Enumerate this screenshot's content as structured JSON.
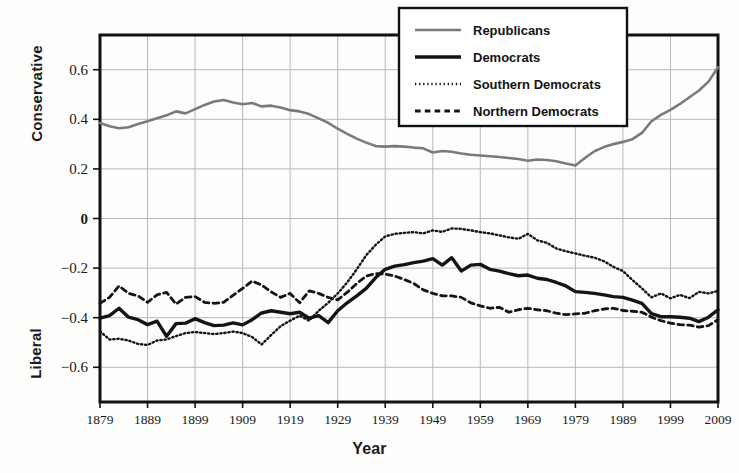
{
  "chart_data": {
    "type": "line",
    "title": "",
    "xlabel": "Year",
    "ylabel": "",
    "ylabel_top": "Conservative",
    "ylabel_bottom": "Liberal",
    "xlim": [
      1879,
      2009
    ],
    "ylim": [
      -0.74,
      0.74
    ],
    "xticks": [
      1879,
      1889,
      1899,
      1909,
      1919,
      1929,
      1939,
      1949,
      1959,
      1969,
      1979,
      1989,
      1999,
      2009
    ],
    "yticks": [
      0.6,
      0.4,
      0.2,
      0,
      -0.2,
      -0.4,
      -0.6
    ],
    "ytick_labels": [
      "0.6",
      "0.4",
      "0.2",
      "0",
      "−0.2",
      "−0.4",
      "−0.6"
    ],
    "grid": true,
    "legend_position": "top-center",
    "x": [
      1879,
      1881,
      1883,
      1885,
      1887,
      1889,
      1891,
      1893,
      1895,
      1897,
      1899,
      1901,
      1903,
      1905,
      1907,
      1909,
      1911,
      1913,
      1915,
      1917,
      1919,
      1921,
      1923,
      1925,
      1927,
      1929,
      1931,
      1933,
      1935,
      1937,
      1939,
      1941,
      1943,
      1945,
      1947,
      1949,
      1951,
      1953,
      1955,
      1957,
      1959,
      1961,
      1963,
      1965,
      1967,
      1969,
      1971,
      1973,
      1975,
      1977,
      1979,
      1981,
      1983,
      1985,
      1987,
      1989,
      1991,
      1993,
      1995,
      1997,
      1999,
      2001,
      2003,
      2005,
      2007,
      2009
    ],
    "series": [
      {
        "name": "Republicans",
        "style": "solid",
        "color": "#7a7a7a",
        "width": 2.6,
        "values": [
          0.385,
          0.372,
          0.364,
          0.368,
          0.381,
          0.392,
          0.404,
          0.416,
          0.432,
          0.424,
          0.441,
          0.458,
          0.472,
          0.478,
          0.468,
          0.461,
          0.466,
          0.452,
          0.455,
          0.448,
          0.437,
          0.432,
          0.421,
          0.404,
          0.386,
          0.362,
          0.341,
          0.322,
          0.306,
          0.292,
          0.29,
          0.292,
          0.29,
          0.286,
          0.283,
          0.266,
          0.272,
          0.269,
          0.262,
          0.257,
          0.254,
          0.251,
          0.248,
          0.244,
          0.24,
          0.233,
          0.238,
          0.236,
          0.231,
          0.222,
          0.214,
          0.244,
          0.271,
          0.288,
          0.3,
          0.309,
          0.32,
          0.345,
          0.392,
          0.418,
          0.438,
          0.462,
          0.489,
          0.516,
          0.552,
          0.61
        ]
      },
      {
        "name": "Democrats",
        "style": "solid",
        "color": "#141414",
        "width": 3.4,
        "values": [
          -0.402,
          -0.392,
          -0.362,
          -0.398,
          -0.408,
          -0.428,
          -0.414,
          -0.475,
          -0.424,
          -0.422,
          -0.404,
          -0.42,
          -0.432,
          -0.43,
          -0.421,
          -0.429,
          -0.408,
          -0.381,
          -0.372,
          -0.378,
          -0.384,
          -0.378,
          -0.402,
          -0.392,
          -0.42,
          -0.372,
          -0.34,
          -0.312,
          -0.282,
          -0.238,
          -0.205,
          -0.192,
          -0.186,
          -0.178,
          -0.172,
          -0.162,
          -0.188,
          -0.158,
          -0.212,
          -0.188,
          -0.185,
          -0.205,
          -0.212,
          -0.222,
          -0.231,
          -0.228,
          -0.241,
          -0.246,
          -0.258,
          -0.272,
          -0.295,
          -0.298,
          -0.302,
          -0.308,
          -0.315,
          -0.318,
          -0.329,
          -0.342,
          -0.384,
          -0.396,
          -0.396,
          -0.398,
          -0.402,
          -0.416,
          -0.398,
          -0.368
        ]
      },
      {
        "name": "Southern Democrats",
        "style": "dotted",
        "color": "#141414",
        "width": 2.4,
        "values": [
          -0.455,
          -0.488,
          -0.485,
          -0.492,
          -0.506,
          -0.51,
          -0.492,
          -0.488,
          -0.474,
          -0.462,
          -0.458,
          -0.462,
          -0.466,
          -0.462,
          -0.456,
          -0.462,
          -0.478,
          -0.508,
          -0.47,
          -0.434,
          -0.412,
          -0.392,
          -0.412,
          -0.372,
          -0.34,
          -0.302,
          -0.258,
          -0.205,
          -0.148,
          -0.106,
          -0.072,
          -0.062,
          -0.058,
          -0.055,
          -0.06,
          -0.048,
          -0.054,
          -0.04,
          -0.042,
          -0.048,
          -0.055,
          -0.06,
          -0.068,
          -0.076,
          -0.082,
          -0.062,
          -0.088,
          -0.098,
          -0.121,
          -0.132,
          -0.141,
          -0.15,
          -0.158,
          -0.172,
          -0.195,
          -0.212,
          -0.248,
          -0.282,
          -0.318,
          -0.302,
          -0.322,
          -0.308,
          -0.321,
          -0.296,
          -0.302,
          -0.292
        ]
      },
      {
        "name": "Northern Democrats",
        "style": "dashed",
        "color": "#141414",
        "width": 2.8,
        "values": [
          -0.342,
          -0.318,
          -0.272,
          -0.302,
          -0.312,
          -0.338,
          -0.308,
          -0.298,
          -0.345,
          -0.318,
          -0.315,
          -0.338,
          -0.342,
          -0.338,
          -0.31,
          -0.282,
          -0.252,
          -0.268,
          -0.296,
          -0.318,
          -0.302,
          -0.34,
          -0.292,
          -0.302,
          -0.318,
          -0.328,
          -0.298,
          -0.262,
          -0.232,
          -0.222,
          -0.224,
          -0.232,
          -0.246,
          -0.262,
          -0.288,
          -0.302,
          -0.312,
          -0.312,
          -0.318,
          -0.34,
          -0.352,
          -0.362,
          -0.358,
          -0.378,
          -0.368,
          -0.362,
          -0.368,
          -0.372,
          -0.382,
          -0.388,
          -0.385,
          -0.382,
          -0.372,
          -0.365,
          -0.362,
          -0.371,
          -0.374,
          -0.378,
          -0.398,
          -0.412,
          -0.422,
          -0.428,
          -0.43,
          -0.438,
          -0.432,
          -0.408
        ]
      }
    ],
    "legend": [
      {
        "label": "Republicans",
        "style": "solid",
        "color": "#7a7a7a"
      },
      {
        "label": "Democrats",
        "style": "solid",
        "color": "#141414"
      },
      {
        "label": "Southern Democrats",
        "style": "dotted",
        "color": "#141414"
      },
      {
        "label": "Northern Democrats",
        "style": "dashed",
        "color": "#141414"
      }
    ]
  }
}
